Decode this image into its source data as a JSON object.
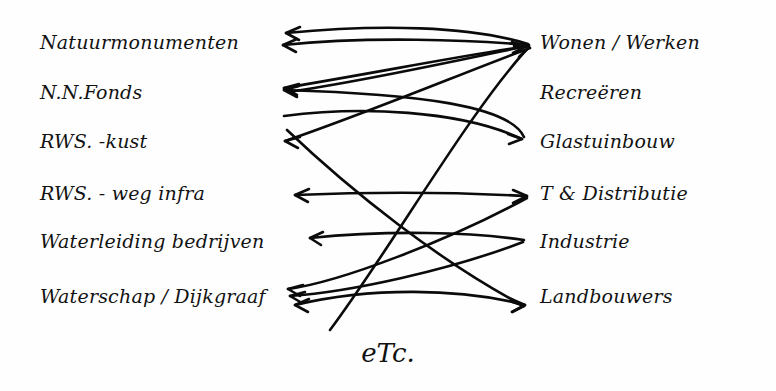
{
  "canvas": {
    "width": 776,
    "height": 391,
    "background": "#fefefe",
    "ink_color": "#0b0b0b"
  },
  "diagram": {
    "kind": "handwritten-bipartite-relation-sketch",
    "footer_note": "eTc.",
    "left_column": {
      "items": [
        {
          "id": "natuurmonumenten",
          "label": "Natuurmonumenten",
          "x": 40,
          "y": 49
        },
        {
          "id": "nn-fonds",
          "label": "N.N.Fonds",
          "x": 40,
          "y": 99
        },
        {
          "id": "rws-kust",
          "label": "RWS. -kust",
          "x": 40,
          "y": 148
        },
        {
          "id": "rws-weg-infra",
          "label": "RWS. - weg infra",
          "x": 40,
          "y": 200
        },
        {
          "id": "waterleiding-bedrijven",
          "label": "Waterleiding bedrijven",
          "x": 40,
          "y": 248
        },
        {
          "id": "waterschap-dijkgraaf",
          "label": "Waterschap / Dijkgraaf",
          "x": 40,
          "y": 303
        }
      ]
    },
    "right_column": {
      "items": [
        {
          "id": "wonen-werken",
          "label": "Wonen / Werken",
          "x": 540,
          "y": 49
        },
        {
          "id": "recreeren",
          "label": "Recreëren",
          "x": 540,
          "y": 99
        },
        {
          "id": "glastuinbouw",
          "label": "Glastuinbouw",
          "x": 540,
          "y": 148
        },
        {
          "id": "t-distributie",
          "label": "T & Distributie",
          "x": 540,
          "y": 200
        },
        {
          "id": "industrie",
          "label": "Industrie",
          "x": 540,
          "y": 248
        },
        {
          "id": "landbouwers",
          "label": "Landbouwers",
          "x": 540,
          "y": 303
        }
      ]
    },
    "connections": [
      {
        "id": "c1",
        "from": "wonen-werken",
        "to": "natuurmonumenten",
        "arrow": "left",
        "note": "upper arc, flat bow"
      },
      {
        "id": "c2",
        "from": "wonen-werken",
        "to": "natuurmonumenten",
        "arrow": "left",
        "note": "second near-parallel arc"
      },
      {
        "id": "c3",
        "from": "wonen-werken",
        "to": "nn-fonds",
        "arrow": "left",
        "note": "long diagonal down-left"
      },
      {
        "id": "c4",
        "from": "wonen-werken",
        "to": "rws-kust",
        "arrow": "left",
        "note": "diagonal to third row"
      },
      {
        "id": "c5",
        "from": "nn-fonds",
        "to": "wonen-werken",
        "arrow": "right",
        "note": "rising diagonal right"
      },
      {
        "id": "c6",
        "from": "glastuinbouw",
        "to": "nn-fonds",
        "arrow": "left",
        "note": "wide bow through middle"
      },
      {
        "id": "c7",
        "from": "rws-kust",
        "to": "glastuinbouw",
        "arrow": "right",
        "note": "shallow rightward arc"
      },
      {
        "id": "c8",
        "from": "waterschap-dijkgraaf",
        "to": "wonen-werken",
        "arrow": "right",
        "note": "steep long diagonal up-right"
      },
      {
        "id": "c9",
        "from": "t-distributie",
        "to": "rws-weg-infra",
        "arrow": "left",
        "note": "straight horizontal row 4"
      },
      {
        "id": "c10",
        "from": "industrie",
        "to": "waterleiding-bedrijven",
        "arrow": "left",
        "note": "flat arc row 5"
      },
      {
        "id": "c11",
        "from": "landbouwers",
        "to": "waterschap-dijkgraaf",
        "arrow": "left",
        "note": "bowed arc row 6"
      },
      {
        "id": "c12",
        "from": "waterschap-dijkgraaf",
        "to": "t-distributie",
        "arrow": "right",
        "note": "diagonal up-right to row 4"
      },
      {
        "id": "c13",
        "from": "waterschap-dijkgraaf",
        "to": "industrie",
        "arrow": "right",
        "note": "diagonal up-right to row 5"
      },
      {
        "id": "c14",
        "from": "rws-kust",
        "to": "landbouwers",
        "arrow": "right",
        "note": "long descending diagonal"
      }
    ]
  }
}
